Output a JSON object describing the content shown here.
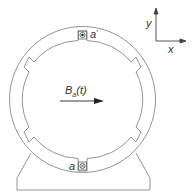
{
  "diagram": {
    "axes": {
      "y_label": "y",
      "x_label": "x"
    },
    "field": {
      "symbol": "B",
      "subscript": "a",
      "argument": "(t)"
    },
    "coils": {
      "top": {
        "label": "a",
        "prime": "′",
        "symbol": "dot",
        "meaning": "current out of page"
      },
      "bottom": {
        "label": "a",
        "symbol": "cross",
        "meaning": "current into page"
      }
    },
    "colors": {
      "line": "#777777",
      "text": "#333333",
      "arrow": "#222222"
    }
  }
}
